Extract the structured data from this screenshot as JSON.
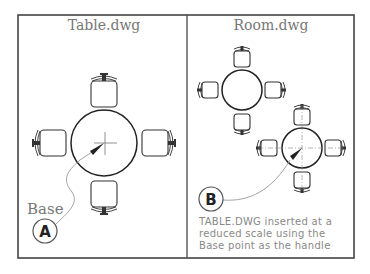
{
  "panels": {
    "left": {
      "title": "Table.dwg",
      "base_label": "Base",
      "callout": "A"
    },
    "right": {
      "title": "Room.dwg",
      "callout": "B",
      "note_lines": [
        "TABLE.DWG inserted at a",
        "reduced scale using the",
        "Base point as the handle"
      ]
    }
  },
  "icons": {
    "table": "round-table-with-four-chairs",
    "base_point": "crosshair-icon",
    "leader_arrow": "arrow-icon"
  },
  "colors": {
    "frame": "#444444",
    "linework": "#222222",
    "title_text": "#777777",
    "note_text": "#888888"
  }
}
